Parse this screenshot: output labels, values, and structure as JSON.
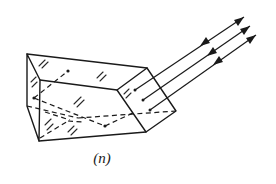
{
  "figure": {
    "caption": "(n)",
    "line_color": "#1a1a1a",
    "background": "#ffffff",
    "rays": [
      {
        "id": "ray-1",
        "direction": "incoming-and-outgoing"
      },
      {
        "id": "ray-2",
        "direction": "incoming-and-outgoing"
      },
      {
        "id": "ray-3",
        "direction": "incoming-and-outgoing"
      }
    ]
  }
}
